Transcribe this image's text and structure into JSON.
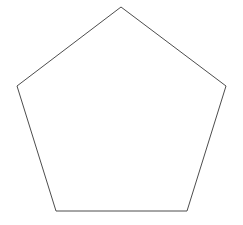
{
  "canvas": {
    "width": 243,
    "height": 225,
    "background_color": "#ffffff",
    "title": "Pentagon"
  },
  "shape": {
    "name": "pentagon",
    "sides": 5,
    "kind": "regular-polygon",
    "fill": "none",
    "fill_color": "#ffffff",
    "stroke_color": "#4d4d4d",
    "stroke_width": 1,
    "closed": true,
    "center": {
      "x": 121.5,
      "y": 93
    },
    "circumradius": 86,
    "rotation_degrees": -90,
    "vertices": [
      {
        "label": "top",
        "x": 121,
        "y": 7
      },
      {
        "label": "right",
        "x": 226,
        "y": 86
      },
      {
        "label": "bottom-right",
        "x": 187,
        "y": 211
      },
      {
        "label": "bottom-left",
        "x": 56,
        "y": 211
      },
      {
        "label": "left",
        "x": 17,
        "y": 86
      }
    ],
    "points_attr": "121,7 226,86 187,211 56,211 17,86"
  }
}
